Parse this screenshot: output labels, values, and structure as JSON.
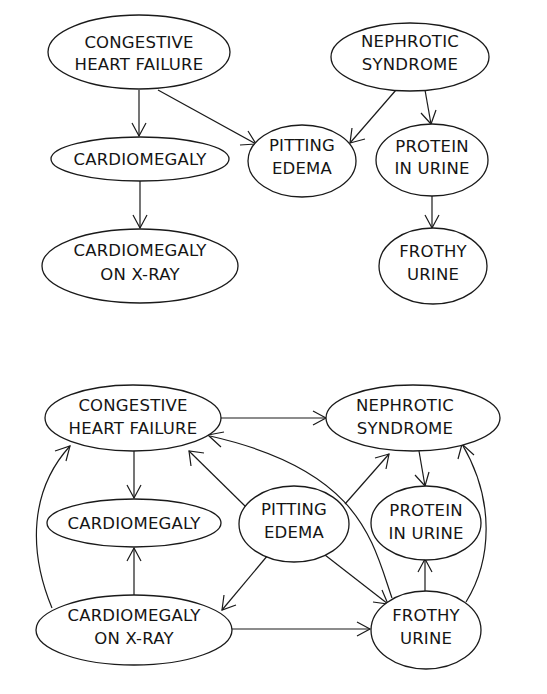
{
  "diagrams": [
    {
      "name": "top",
      "nodes": {
        "chf": {
          "line1": "CONGESTIVE",
          "line2": "HEART FAILURE"
        },
        "nephrotic": {
          "line1": "NEPHROTIC",
          "line2": "SYNDROME"
        },
        "cardiomegaly": {
          "line1": "CARDIOMEGALY"
        },
        "pitting": {
          "line1": "PITTING",
          "line2": "EDEMA"
        },
        "protein": {
          "line1": "PROTEIN",
          "line2": "IN URINE"
        },
        "xray": {
          "line1": "CARDIOMEGALY",
          "line2": "ON X-RAY"
        },
        "frothy": {
          "line1": "FROTHY",
          "line2": "URINE"
        }
      },
      "edges": [
        [
          "CONGESTIVE HEART FAILURE",
          "CARDIOMEGALY"
        ],
        [
          "CONGESTIVE HEART FAILURE",
          "PITTING EDEMA"
        ],
        [
          "NEPHROTIC SYNDROME",
          "PITTING EDEMA"
        ],
        [
          "NEPHROTIC SYNDROME",
          "PROTEIN IN URINE"
        ],
        [
          "CARDIOMEGALY",
          "CARDIOMEGALY ON X-RAY"
        ],
        [
          "PROTEIN IN URINE",
          "FROTHY URINE"
        ]
      ]
    },
    {
      "name": "bottom",
      "nodes": {
        "chf": {
          "line1": "CONGESTIVE",
          "line2": "HEART FAILURE"
        },
        "nephrotic": {
          "line1": "NEPHROTIC",
          "line2": "SYNDROME"
        },
        "cardiomegaly": {
          "line1": "CARDIOMEGALY"
        },
        "pitting": {
          "line1": "PITTING",
          "line2": "EDEMA"
        },
        "protein": {
          "line1": "PROTEIN",
          "line2": "IN URINE"
        },
        "xray": {
          "line1": "CARDIOMEGALY",
          "line2": "ON X-RAY"
        },
        "frothy": {
          "line1": "FROTHY",
          "line2": "URINE"
        }
      },
      "edges": [
        [
          "CONGESTIVE HEART FAILURE",
          "NEPHROTIC SYNDROME"
        ],
        [
          "CONGESTIVE HEART FAILURE",
          "CARDIOMEGALY"
        ],
        [
          "PITTING EDEMA",
          "CONGESTIVE HEART FAILURE"
        ],
        [
          "FROTHY URINE",
          "CONGESTIVE HEART FAILURE"
        ],
        [
          "CARDIOMEGALY ON X-RAY",
          "CONGESTIVE HEART FAILURE"
        ],
        [
          "PITTING EDEMA",
          "NEPHROTIC SYNDROME"
        ],
        [
          "NEPHROTIC SYNDROME",
          "PROTEIN IN URINE"
        ],
        [
          "FROTHY URINE",
          "NEPHROTIC SYNDROME"
        ],
        [
          "PITTING EDEMA",
          "CARDIOMEGALY ON X-RAY"
        ],
        [
          "PITTING EDEMA",
          "FROTHY URINE"
        ],
        [
          "CARDIOMEGALY ON X-RAY",
          "CARDIOMEGALY"
        ],
        [
          "CARDIOMEGALY ON X-RAY",
          "FROTHY URINE"
        ],
        [
          "FROTHY URINE",
          "PROTEIN IN URINE"
        ]
      ]
    }
  ]
}
